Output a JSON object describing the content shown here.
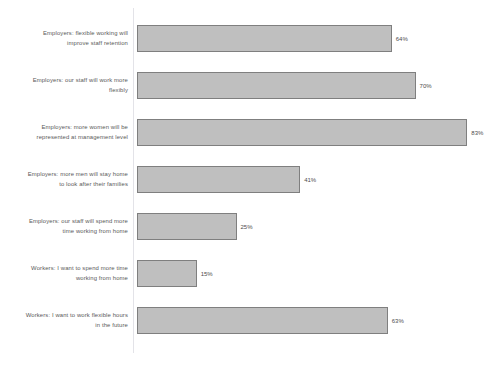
{
  "chart_data": {
    "type": "bar",
    "orientation": "horizontal",
    "title": "",
    "subtitle": "",
    "xlabel": "",
    "ylabel": "",
    "xlim": [
      0,
      100
    ],
    "grid": false,
    "legend": "none",
    "value_suffix": "%",
    "bar_color": "#bfbfbf",
    "bar_border_color": "#7f7f7f",
    "label_color": "#595959",
    "axis_color": "#e3e3e8",
    "categories": [
      "Employers:  flexible working will improve staff retention",
      "Employers:  our staff will work more flexibly",
      "Employers:  more women will be represented at management level",
      "Employers:  more men will stay home to look after their families",
      "Employers:  our staff will spend more time working from home",
      "Workers:  I want to spend more time working from home",
      "Workers:  I want to work flexible hours in the future"
    ],
    "values": [
      64,
      70,
      83,
      41,
      25,
      15,
      63
    ],
    "value_labels": [
      "64%",
      "70%",
      "83%",
      "41%",
      "25%",
      "15%",
      "63%"
    ],
    "bars": [
      {
        "category": "Employers:  flexible working will improve staff retention",
        "label_lines": "Employers:  flexible working will\nimprove staff retention",
        "value": 64,
        "value_label": "64%"
      },
      {
        "category": "Employers:  our staff will work more flexibly",
        "label_lines": "Employers:  our staff will work more\nflexibly",
        "value": 70,
        "value_label": "70%"
      },
      {
        "category": "Employers:  more women will be represented at management level",
        "label_lines": "Employers:  more women will be\nrepresented at management level",
        "value": 83,
        "value_label": "83%"
      },
      {
        "category": "Employers:  more men will stay home to look after their families",
        "label_lines": "Employers:  more men will stay home\nto look after their families",
        "value": 41,
        "value_label": "41%"
      },
      {
        "category": "Employers:  our staff will spend more time working from home",
        "label_lines": "Employers:  our staff will spend more\ntime working from home",
        "value": 25,
        "value_label": "25%"
      },
      {
        "category": "Workers:  I want to spend more time working from home",
        "label_lines": "Workers:  I want to spend more time\nworking from home",
        "value": 15,
        "value_label": "15%"
      },
      {
        "category": "Workers:  I want to work flexible hours in the future",
        "label_lines": "Workers:  I want to work flexible hours\nin the future",
        "value": 63,
        "value_label": "63%"
      }
    ]
  }
}
